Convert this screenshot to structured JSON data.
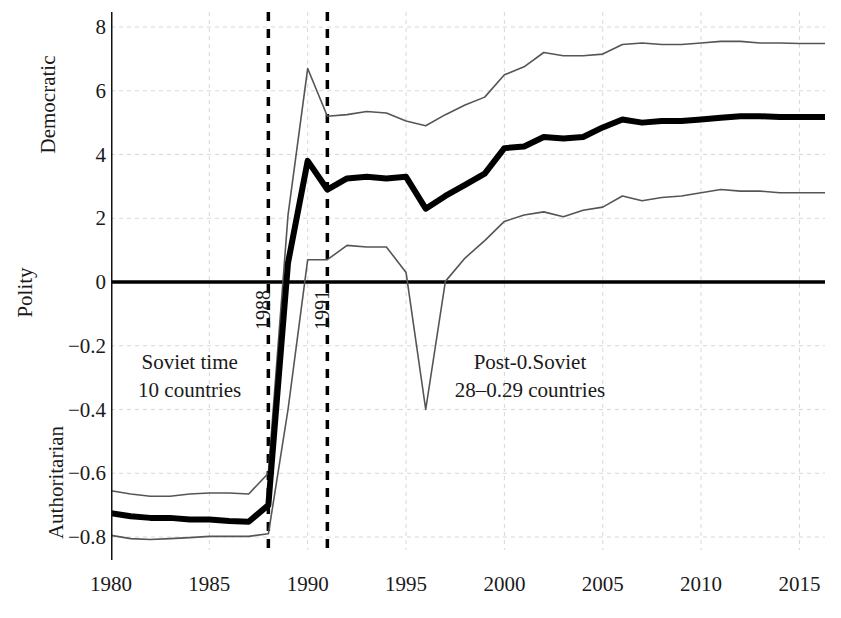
{
  "chart_data": {
    "type": "line",
    "title": "",
    "xlabel": "",
    "ylabel": "Polity",
    "y_axis_group_labels": {
      "top": "Democratic",
      "middle": "Polity",
      "bottom": "Authoritarian"
    },
    "xlim": [
      1980,
      2016.3
    ],
    "ylim": [
      -0.9,
      8.6
    ],
    "grid": true,
    "legend_position": "none",
    "x_tick_labels": [
      "1980",
      "1985",
      "1990",
      "1995",
      "2000",
      "2005",
      "2010",
      "2015"
    ],
    "x_ticks": [
      1980,
      1985,
      1990,
      1995,
      2000,
      2005,
      2010,
      2015
    ],
    "y_tick_labels": [
      "8",
      "6",
      "4",
      "2",
      "0",
      "−0.2",
      "−0.4",
      "−0.6",
      "−0.8"
    ],
    "y_ticks": [
      8,
      6,
      4,
      2,
      0,
      -0.2,
      -0.4,
      -0.6,
      -0.8
    ],
    "annotations": [
      {
        "name": "soviet-period",
        "line1": "Soviet time",
        "line2": "10 countries",
        "x": 1984.0,
        "y": -0.28
      },
      {
        "name": "post-soviet-period",
        "line1": "Post-0.Soviet",
        "line2": "28–0.29 countries",
        "x": 2001.3,
        "y": -0.28
      }
    ],
    "vertical_reference_lines": [
      {
        "label": "1988",
        "x": 1988,
        "style": "dashed"
      },
      {
        "label": "1991",
        "x": 1991,
        "style": "dashed"
      }
    ],
    "horizontal_reference_lines": [
      {
        "y": 0,
        "style": "solid",
        "color": "#000000"
      }
    ],
    "x": [
      1980,
      1981,
      1982,
      1983,
      1984,
      1985,
      1986,
      1987,
      1988,
      1989,
      1990,
      1991,
      1992,
      1993,
      1994,
      1995,
      1996,
      1997,
      1998,
      1999,
      2000,
      2001,
      2002,
      2003,
      2004,
      2005,
      2006,
      2007,
      2008,
      2009,
      2010,
      2011,
      2012,
      2013,
      2014,
      2015,
      2016.3
    ],
    "series": [
      {
        "name": "Mean Polity score",
        "style": "thick-black",
        "color": "#000000",
        "width": 6,
        "values": [
          -0.725,
          -0.735,
          -0.74,
          -0.74,
          -0.745,
          -0.745,
          -0.75,
          -0.752,
          -0.7,
          0.6,
          3.8,
          2.9,
          3.25,
          3.3,
          3.25,
          3.3,
          2.3,
          2.7,
          3.05,
          3.4,
          4.2,
          4.25,
          4.55,
          4.5,
          4.55,
          4.85,
          5.1,
          5.0,
          5.05,
          5.05,
          5.1,
          5.15,
          5.2,
          5.2,
          5.18,
          5.18,
          5.18
        ]
      },
      {
        "name": "Upper confidence bound",
        "style": "thin-gray",
        "color": "#555555",
        "width": 1.6,
        "values": [
          -0.655,
          -0.665,
          -0.672,
          -0.672,
          -0.665,
          -0.662,
          -0.662,
          -0.665,
          -0.6,
          2.1,
          6.7,
          5.2,
          5.25,
          5.35,
          5.3,
          5.05,
          4.9,
          5.25,
          5.55,
          5.8,
          6.5,
          6.75,
          7.2,
          7.1,
          7.1,
          7.15,
          7.45,
          7.5,
          7.45,
          7.45,
          7.5,
          7.55,
          7.55,
          7.5,
          7.5,
          7.48,
          7.48
        ]
      },
      {
        "name": "Lower confidence bound",
        "style": "thin-gray",
        "color": "#555555",
        "width": 1.6,
        "values": [
          -0.795,
          -0.805,
          -0.808,
          -0.805,
          -0.802,
          -0.798,
          -0.798,
          -0.798,
          -0.79,
          -0.4,
          0.7,
          0.7,
          1.15,
          1.1,
          1.1,
          0.3,
          -0.4,
          0.02,
          0.75,
          1.3,
          1.9,
          2.1,
          2.2,
          2.05,
          2.25,
          2.35,
          2.7,
          2.55,
          2.65,
          2.7,
          2.8,
          2.9,
          2.85,
          2.85,
          2.8,
          2.8,
          2.8
        ]
      }
    ]
  }
}
